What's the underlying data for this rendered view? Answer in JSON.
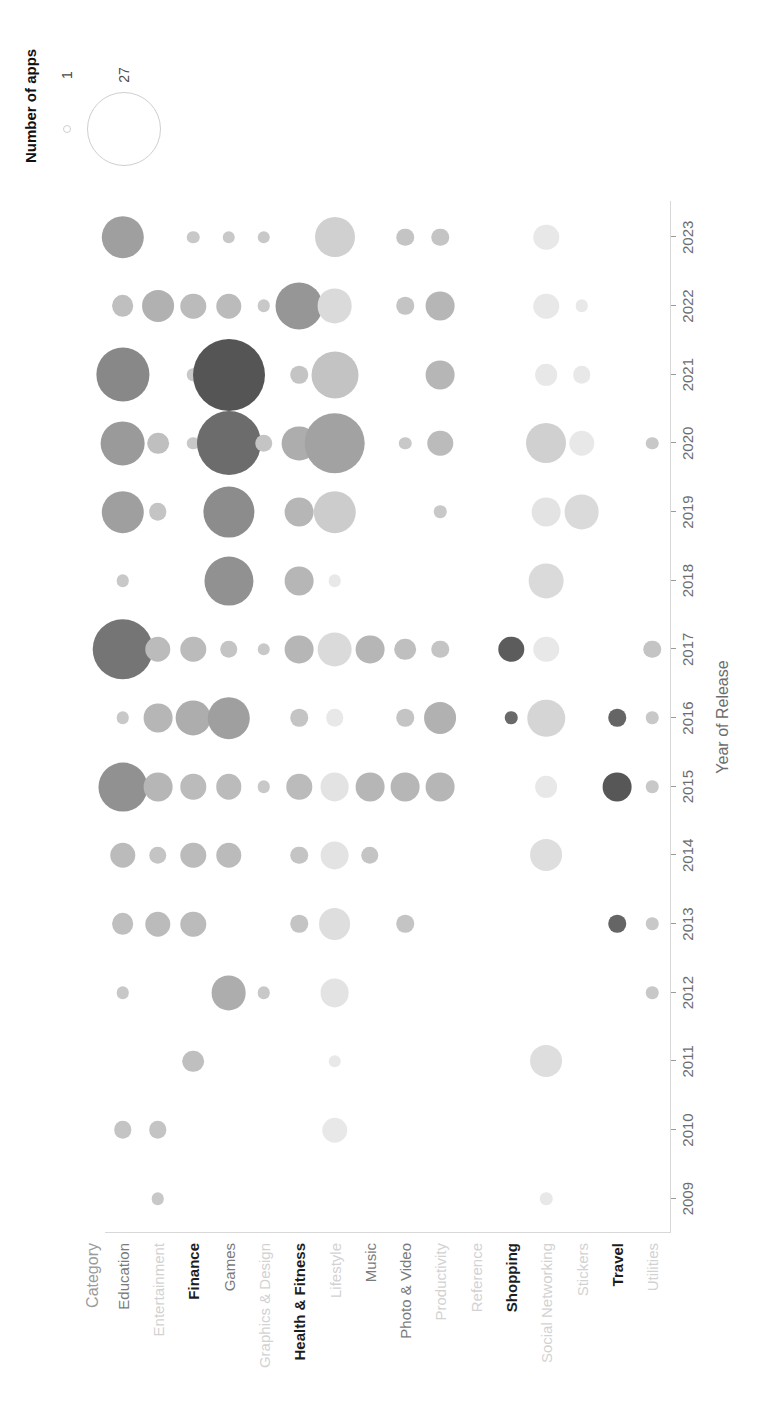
{
  "chart_data": {
    "type": "scatter",
    "title": "",
    "xlabel": "Year of Release",
    "ylabel": "Category",
    "x": [
      2009,
      2010,
      2011,
      2012,
      2013,
      2014,
      2015,
      2016,
      2017,
      2018,
      2019,
      2020,
      2021,
      2022,
      2023
    ],
    "x_tick_labels": [
      "2009",
      "2010",
      "2011",
      "2012",
      "2013",
      "2014",
      "2015",
      "2016",
      "2017",
      "2018",
      "2019",
      "2020",
      "2021",
      "2022",
      "2023"
    ],
    "categories": [
      "Education",
      "Entertainment",
      "Finance",
      "Games",
      "Graphics & Design",
      "Health & Fitness",
      "Lifestyle",
      "Music",
      "Photo & Video",
      "Productivity",
      "Reference",
      "Shopping",
      "Social Networking",
      "Stickers",
      "Travel",
      "Utilities"
    ],
    "category_label_styles": [
      "reg",
      "faint",
      "bold",
      "reg",
      "faint",
      "bold",
      "faint",
      "reg",
      "reg",
      "faint",
      "faint",
      "bold",
      "faint",
      "faint",
      "bold",
      "faint"
    ],
    "size_legend": {
      "title": "Number of apps",
      "values": [
        1,
        27
      ],
      "labels": [
        "1",
        "27"
      ]
    },
    "grid": false,
    "legend_position": "top-right",
    "value_range": [
      1,
      27
    ],
    "points": [
      {
        "category": "Education",
        "year": 2010,
        "value": 3
      },
      {
        "category": "Education",
        "year": 2012,
        "value": 2
      },
      {
        "category": "Education",
        "year": 2013,
        "value": 4
      },
      {
        "category": "Education",
        "year": 2014,
        "value": 5
      },
      {
        "category": "Education",
        "year": 2015,
        "value": 14
      },
      {
        "category": "Education",
        "year": 2016,
        "value": 2
      },
      {
        "category": "Education",
        "year": 2017,
        "value": 20
      },
      {
        "category": "Education",
        "year": 2018,
        "value": 2
      },
      {
        "category": "Education",
        "year": 2019,
        "value": 11
      },
      {
        "category": "Education",
        "year": 2020,
        "value": 12
      },
      {
        "category": "Education",
        "year": 2021,
        "value": 16
      },
      {
        "category": "Education",
        "year": 2022,
        "value": 4
      },
      {
        "category": "Education",
        "year": 2023,
        "value": 11
      },
      {
        "category": "Entertainment",
        "year": 2009,
        "value": 2
      },
      {
        "category": "Entertainment",
        "year": 2010,
        "value": 3
      },
      {
        "category": "Entertainment",
        "year": 2013,
        "value": 5
      },
      {
        "category": "Entertainment",
        "year": 2014,
        "value": 3
      },
      {
        "category": "Entertainment",
        "year": 2015,
        "value": 6
      },
      {
        "category": "Entertainment",
        "year": 2016,
        "value": 6
      },
      {
        "category": "Entertainment",
        "year": 2017,
        "value": 5
      },
      {
        "category": "Entertainment",
        "year": 2019,
        "value": 3
      },
      {
        "category": "Entertainment",
        "year": 2020,
        "value": 4
      },
      {
        "category": "Entertainment",
        "year": 2022,
        "value": 7
      },
      {
        "category": "Finance",
        "year": 2011,
        "value": 4
      },
      {
        "category": "Finance",
        "year": 2013,
        "value": 5
      },
      {
        "category": "Finance",
        "year": 2014,
        "value": 5
      },
      {
        "category": "Finance",
        "year": 2015,
        "value": 5
      },
      {
        "category": "Finance",
        "year": 2016,
        "value": 8
      },
      {
        "category": "Finance",
        "year": 2017,
        "value": 5
      },
      {
        "category": "Finance",
        "year": 2020,
        "value": 2
      },
      {
        "category": "Finance",
        "year": 2021,
        "value": 2
      },
      {
        "category": "Finance",
        "year": 2022,
        "value": 5
      },
      {
        "category": "Finance",
        "year": 2023,
        "value": 2
      },
      {
        "category": "Games",
        "year": 2012,
        "value": 8
      },
      {
        "category": "Games",
        "year": 2014,
        "value": 5
      },
      {
        "category": "Games",
        "year": 2015,
        "value": 5
      },
      {
        "category": "Games",
        "year": 2016,
        "value": 11
      },
      {
        "category": "Games",
        "year": 2017,
        "value": 3
      },
      {
        "category": "Games",
        "year": 2018,
        "value": 14
      },
      {
        "category": "Games",
        "year": 2019,
        "value": 15
      },
      {
        "category": "Games",
        "year": 2020,
        "value": 22
      },
      {
        "category": "Games",
        "year": 2021,
        "value": 27
      },
      {
        "category": "Games",
        "year": 2022,
        "value": 5
      },
      {
        "category": "Games",
        "year": 2023,
        "value": 2
      },
      {
        "category": "Graphics & Design",
        "year": 2012,
        "value": 2
      },
      {
        "category": "Graphics & Design",
        "year": 2015,
        "value": 2
      },
      {
        "category": "Graphics & Design",
        "year": 2017,
        "value": 2
      },
      {
        "category": "Graphics & Design",
        "year": 2020,
        "value": 3
      },
      {
        "category": "Graphics & Design",
        "year": 2022,
        "value": 2
      },
      {
        "category": "Graphics & Design",
        "year": 2023,
        "value": 2
      },
      {
        "category": "Health & Fitness",
        "year": 2013,
        "value": 3
      },
      {
        "category": "Health & Fitness",
        "year": 2014,
        "value": 3
      },
      {
        "category": "Health & Fitness",
        "year": 2015,
        "value": 5
      },
      {
        "category": "Health & Fitness",
        "year": 2016,
        "value": 3
      },
      {
        "category": "Health & Fitness",
        "year": 2017,
        "value": 6
      },
      {
        "category": "Health & Fitness",
        "year": 2018,
        "value": 6
      },
      {
        "category": "Health & Fitness",
        "year": 2019,
        "value": 6
      },
      {
        "category": "Health & Fitness",
        "year": 2020,
        "value": 8
      },
      {
        "category": "Health & Fitness",
        "year": 2021,
        "value": 3
      },
      {
        "category": "Health & Fitness",
        "year": 2022,
        "value": 13
      },
      {
        "category": "Lifestyle",
        "year": 2010,
        "value": 5
      },
      {
        "category": "Lifestyle",
        "year": 2011,
        "value": 2
      },
      {
        "category": "Lifestyle",
        "year": 2012,
        "value": 6
      },
      {
        "category": "Lifestyle",
        "year": 2013,
        "value": 7
      },
      {
        "category": "Lifestyle",
        "year": 2014,
        "value": 6
      },
      {
        "category": "Lifestyle",
        "year": 2015,
        "value": 6
      },
      {
        "category": "Lifestyle",
        "year": 2016,
        "value": 3
      },
      {
        "category": "Lifestyle",
        "year": 2017,
        "value": 8
      },
      {
        "category": "Lifestyle",
        "year": 2018,
        "value": 2
      },
      {
        "category": "Lifestyle",
        "year": 2019,
        "value": 11
      },
      {
        "category": "Lifestyle",
        "year": 2020,
        "value": 20
      },
      {
        "category": "Lifestyle",
        "year": 2021,
        "value": 13
      },
      {
        "category": "Lifestyle",
        "year": 2022,
        "value": 8
      },
      {
        "category": "Lifestyle",
        "year": 2023,
        "value": 10
      },
      {
        "category": "Music",
        "year": 2014,
        "value": 3
      },
      {
        "category": "Music",
        "year": 2015,
        "value": 6
      },
      {
        "category": "Music",
        "year": 2017,
        "value": 6
      },
      {
        "category": "Photo & Video",
        "year": 2013,
        "value": 3
      },
      {
        "category": "Photo & Video",
        "year": 2015,
        "value": 6
      },
      {
        "category": "Photo & Video",
        "year": 2016,
        "value": 3
      },
      {
        "category": "Photo & Video",
        "year": 2017,
        "value": 4
      },
      {
        "category": "Photo & Video",
        "year": 2020,
        "value": 2
      },
      {
        "category": "Photo & Video",
        "year": 2022,
        "value": 3
      },
      {
        "category": "Photo & Video",
        "year": 2023,
        "value": 3
      },
      {
        "category": "Productivity",
        "year": 2015,
        "value": 6
      },
      {
        "category": "Productivity",
        "year": 2016,
        "value": 7
      },
      {
        "category": "Productivity",
        "year": 2017,
        "value": 3
      },
      {
        "category": "Productivity",
        "year": 2019,
        "value": 2
      },
      {
        "category": "Productivity",
        "year": 2020,
        "value": 5
      },
      {
        "category": "Productivity",
        "year": 2021,
        "value": 6
      },
      {
        "category": "Productivity",
        "year": 2022,
        "value": 6
      },
      {
        "category": "Productivity",
        "year": 2023,
        "value": 3
      },
      {
        "category": "Shopping",
        "year": 2016,
        "value": 2
      },
      {
        "category": "Shopping",
        "year": 2017,
        "value": 5
      },
      {
        "category": "Social Networking",
        "year": 2009,
        "value": 2
      },
      {
        "category": "Social Networking",
        "year": 2011,
        "value": 7
      },
      {
        "category": "Social Networking",
        "year": 2014,
        "value": 7
      },
      {
        "category": "Social Networking",
        "year": 2015,
        "value": 4
      },
      {
        "category": "Social Networking",
        "year": 2016,
        "value": 9
      },
      {
        "category": "Social Networking",
        "year": 2017,
        "value": 5
      },
      {
        "category": "Social Networking",
        "year": 2018,
        "value": 8
      },
      {
        "category": "Social Networking",
        "year": 2019,
        "value": 6
      },
      {
        "category": "Social Networking",
        "year": 2020,
        "value": 10
      },
      {
        "category": "Social Networking",
        "year": 2021,
        "value": 4
      },
      {
        "category": "Social Networking",
        "year": 2022,
        "value": 5
      },
      {
        "category": "Social Networking",
        "year": 2023,
        "value": 5
      },
      {
        "category": "Stickers",
        "year": 2019,
        "value": 8
      },
      {
        "category": "Stickers",
        "year": 2020,
        "value": 5
      },
      {
        "category": "Stickers",
        "year": 2021,
        "value": 3
      },
      {
        "category": "Stickers",
        "year": 2022,
        "value": 2
      },
      {
        "category": "Travel",
        "year": 2013,
        "value": 3
      },
      {
        "category": "Travel",
        "year": 2015,
        "value": 6
      },
      {
        "category": "Travel",
        "year": 2016,
        "value": 3
      },
      {
        "category": "Utilities",
        "year": 2012,
        "value": 2
      },
      {
        "category": "Utilities",
        "year": 2013,
        "value": 2
      },
      {
        "category": "Utilities",
        "year": 2015,
        "value": 2
      },
      {
        "category": "Utilities",
        "year": 2016,
        "value": 2
      },
      {
        "category": "Utilities",
        "year": 2017,
        "value": 3
      },
      {
        "category": "Utilities",
        "year": 2020,
        "value": 2
      }
    ]
  }
}
